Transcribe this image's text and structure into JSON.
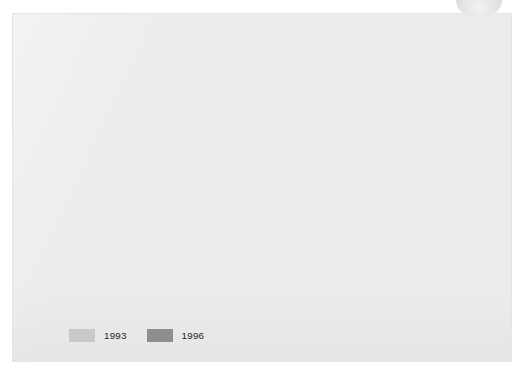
{
  "figure": {
    "label": "Figure 5.3",
    "caption_part1": "Percentage of 16–24-year-olds who agree with the statement: ‘I should ",
    "caption_italic": "not",
    "caption_part2": " have to pay more for environmentally friendly products’"
  },
  "colors": {
    "panel_background": "#ececed",
    "page_background": "#ffffff",
    "axis": "#8d8d8d",
    "series_1993": "#c9c9c9",
    "series_1996": "#8e8e8e",
    "text": "#16161a"
  },
  "chart_data": {
    "type": "bar",
    "xlabel": "",
    "ylabel": "",
    "ylim": [
      0,
      100
    ],
    "yticks": [
      0,
      10,
      20,
      30,
      40,
      50,
      60,
      70,
      80,
      90,
      100
    ],
    "ytick_labels": [
      "0",
      "10",
      "20",
      "30",
      "40",
      "50",
      "60",
      "70",
      "80",
      "90",
      "100"
    ],
    "grid": false,
    "legend_position": "bottom-left",
    "categories": [
      "UK",
      "France",
      "Germany",
      "Italy",
      "NL",
      "Spain"
    ],
    "series": [
      {
        "name": "1993",
        "color": "#c9c9c9",
        "values": [
          73,
          76,
          93,
          72,
          65,
          77
        ]
      },
      {
        "name": "1996",
        "color": "#8e8e8e",
        "values": [
          82,
          76,
          86,
          70,
          60,
          71
        ]
      }
    ]
  }
}
